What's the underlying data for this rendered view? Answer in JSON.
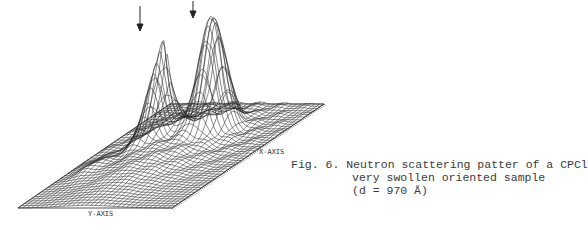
{
  "figure": {
    "number": "Fig. 6.",
    "caption_lines": [
      "Neutron scattering patter of a CPCl",
      "very swollen oriented sample",
      "(d = 970 Å)"
    ],
    "x_axis_label": "X-AXIS",
    "y_axis_label": "Y-AXIS",
    "arrows": [
      "down-arrow",
      "down-arrow"
    ]
  },
  "chart_data": {
    "type": "surface-3d-wireframe",
    "xlabel": "X-AXIS",
    "ylabel": "Y-AXIS",
    "zlabel": "",
    "grid": false,
    "legend": null,
    "annotations": [
      {
        "type": "arrow",
        "points_to": "left peak (sharp)"
      },
      {
        "type": "arrow",
        "points_to": "right peak (tallest)"
      }
    ],
    "peaks": [
      {
        "name": "left peak",
        "relative_height": 0.78
      },
      {
        "name": "right peak",
        "relative_height": 1.0
      }
    ],
    "colors": {
      "line": "#222222",
      "background": "#ffffff"
    }
  }
}
